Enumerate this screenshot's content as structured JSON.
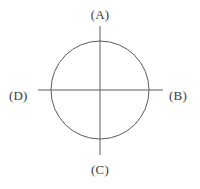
{
  "figure": {
    "type": "geometry-diagram",
    "background_color": "#ffffff",
    "stroke_color": "#5a5a5a",
    "text_color": "#3b3b3b",
    "stroke_width": 1
  },
  "geometry": {
    "circle": {
      "center_x": 100,
      "center_y": 90,
      "radius": 50
    },
    "vertical_line": {
      "x": 100,
      "y_start": 26,
      "y_end": 155
    },
    "horizontal_line": {
      "y": 90,
      "x_start": 38,
      "x_end": 163
    }
  },
  "labels": {
    "top": "(A)",
    "right": "(B)",
    "bottom": "(C)",
    "left": "(D)"
  }
}
